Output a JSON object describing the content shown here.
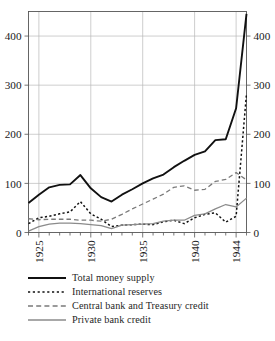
{
  "chart_data": {
    "type": "line",
    "title": "",
    "subtitle": "",
    "xlabel": "",
    "ylabel": "",
    "xlim": [
      1924,
      1945
    ],
    "ylim": [
      0,
      450
    ],
    "yticks": [
      0,
      100,
      200,
      300,
      400
    ],
    "ytick_labels": [
      "0",
      "100",
      "200",
      "300",
      "400"
    ],
    "xticks": [
      1925,
      1930,
      1935,
      1940,
      1944
    ],
    "xtick_labels": [
      "1925",
      "1930",
      "1935",
      "1940",
      "1944"
    ],
    "xtick_rotation": 90,
    "grid": "both-major",
    "dual_axis": true,
    "right_axis_mirrors_left": true,
    "right_ytick_labels": [
      "0",
      "100",
      "200",
      "300",
      "400"
    ],
    "legend_position": "below-axes",
    "x": [
      1924,
      1925,
      1926,
      1927,
      1928,
      1929,
      1930,
      1931,
      1932,
      1933,
      1934,
      1935,
      1936,
      1937,
      1938,
      1939,
      1940,
      1941,
      1942,
      1943,
      1944,
      1945
    ],
    "series": [
      {
        "name": "Total money supply",
        "style": "solid",
        "color": "#111111",
        "width": 1.9,
        "values": [
          60,
          77,
          92,
          97,
          98,
          117,
          90,
          72,
          63,
          77,
          88,
          100,
          110,
          118,
          133,
          146,
          158,
          165,
          188,
          190,
          253,
          445
        ]
      },
      {
        "name": "International reserves",
        "style": "dotted",
        "color": "#111111",
        "width": 1.5,
        "values": [
          18,
          30,
          33,
          38,
          42,
          63,
          38,
          27,
          12,
          15,
          16,
          17,
          16,
          22,
          25,
          18,
          30,
          37,
          40,
          21,
          33,
          283
        ]
      },
      {
        "name": "Central bank and Treasury credit",
        "style": "dashed",
        "color": "#7a7a7a",
        "width": 1.3,
        "values": [
          28,
          26,
          27,
          27,
          27,
          25,
          25,
          23,
          27,
          37,
          48,
          58,
          68,
          78,
          92,
          95,
          86,
          88,
          104,
          108,
          122,
          107
        ]
      },
      {
        "name": "Private bank credit",
        "style": "solid",
        "color": "#8b8b8b",
        "width": 1.3,
        "values": [
          3,
          12,
          17,
          19,
          19,
          18,
          16,
          14,
          8,
          15,
          16,
          17,
          18,
          23,
          25,
          25,
          35,
          38,
          48,
          57,
          52,
          70
        ]
      }
    ]
  },
  "legend": {
    "items": [
      {
        "label": "Total money supply"
      },
      {
        "label": "International reserves"
      },
      {
        "label": "Central bank and Treasury credit"
      },
      {
        "label": "Private bank credit"
      }
    ]
  }
}
